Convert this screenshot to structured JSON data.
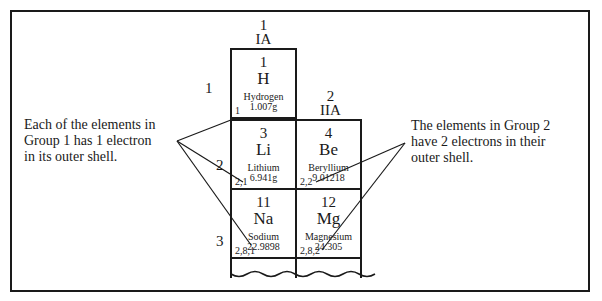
{
  "groups": [
    {
      "number": "1",
      "roman": "IA"
    },
    {
      "number": "2",
      "roman": "IIA"
    }
  ],
  "periods": [
    "1",
    "2",
    "3"
  ],
  "elements": [
    {
      "number": "1",
      "symbol": "H",
      "name": "Hydrogen",
      "mass": "1.007g",
      "config": "1"
    },
    {
      "number": "3",
      "symbol": "Li",
      "name": "Lithium",
      "mass": "6.941g",
      "config": "2,1"
    },
    {
      "number": "4",
      "symbol": "Be",
      "name": "Beryllium",
      "mass": "9.01218",
      "config": "2,2"
    },
    {
      "number": "11",
      "symbol": "Na",
      "name": "Sodium",
      "mass": "22.9898",
      "config": "2,8,1"
    },
    {
      "number": "12",
      "symbol": "Mg",
      "name": "Magnesium",
      "mass": "24.305",
      "config": "2,8,2"
    }
  ],
  "callouts": {
    "group1": [
      "Each of the elements in",
      "Group 1 has 1 electron",
      "in its outer shell."
    ],
    "group2": [
      "The elements in Group 2",
      "have 2 electrons in their",
      "outer shell."
    ]
  },
  "colors": {
    "ink": "#1a1a1a",
    "background": "#ffffff"
  }
}
